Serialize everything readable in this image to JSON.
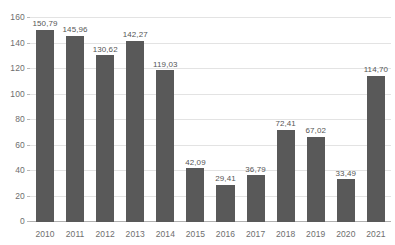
{
  "chart_data": {
    "type": "bar",
    "title": "",
    "subtitle": "",
    "xlabel": "",
    "ylabel": "",
    "categories": [
      "2010",
      "2011",
      "2012",
      "2013",
      "2014",
      "2015",
      "2016",
      "2017",
      "2018",
      "2019",
      "2020",
      "2021"
    ],
    "values": [
      150.79,
      145.96,
      130.62,
      142.27,
      119.03,
      42.09,
      29.41,
      36.79,
      72.41,
      67.02,
      33.49,
      114.7
    ],
    "value_labels": [
      "150,79",
      "145,96",
      "130,62",
      "142,27",
      "119,03",
      "42,09",
      "29,41",
      "36,79",
      "72,41",
      "67,02",
      "33,49",
      "114,70"
    ],
    "ylim": [
      0,
      160
    ],
    "ytick_values": [
      0,
      20,
      40,
      60,
      80,
      100,
      120,
      140,
      160
    ],
    "ytick_labels": [
      "0",
      "20",
      "40",
      "60",
      "80",
      "100",
      "120",
      "140",
      "160"
    ],
    "grid": true,
    "legend": false,
    "legend_position": "none",
    "series": [
      {
        "name": "",
        "color": "#595959",
        "values": [
          150.79,
          145.96,
          130.62,
          142.27,
          119.03,
          42.09,
          29.41,
          36.79,
          72.41,
          67.02,
          33.49,
          114.7
        ]
      }
    ],
    "colors": {
      "bar": "#595959",
      "gridline": "#e3e3e3",
      "axis": "#b0b0b0",
      "tick_text": "#6e6e6e",
      "value_text": "#555555",
      "background": "#ffffff"
    }
  }
}
